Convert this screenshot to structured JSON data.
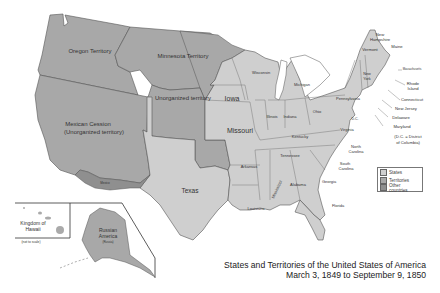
{
  "map": {
    "title": "States and Territories of the United States of America",
    "subtitle": "March 3, 1849 to September 9, 1850",
    "colors": {
      "states": "#cfcfcf",
      "territories": "#a8a8a8",
      "other_countries": "#8f8f8f",
      "border": "#555555",
      "water": "#ffffff"
    },
    "legend": [
      {
        "label": "States",
        "color": "#cfcfcf"
      },
      {
        "label": "Territories",
        "color": "#a8a8a8"
      },
      {
        "label": "Other countries",
        "color": "#8f8f8f"
      }
    ],
    "territories": {
      "oregon": "Oregon Territory",
      "minnesota": "Minnesota Territory",
      "unorganized": "Unorganized territory",
      "mexican_cession_1": "Mexican Cession",
      "mexican_cession_2": "(Unorganized territory)",
      "mexico": "Mexico"
    },
    "states": {
      "texas": "Texas",
      "iowa": "Iowa",
      "missouri": "Missouri",
      "wisconsin": "Wisconsin",
      "michigan": "Michigan",
      "illinois": "Illinois",
      "indiana": "Indiana",
      "ohio": "Ohio",
      "kentucky": "Kentucky",
      "tennessee": "Tennessee",
      "arkansas": "Arkansas",
      "louisiana": "Louisiana",
      "mississippi": "Mississippi",
      "alabama": "Alabama",
      "georgia": "Georgia",
      "florida": "Florida",
      "south_carolina_1": "South",
      "south_carolina_2": "Carolina",
      "north_carolina_1": "North",
      "north_carolina_2": "Carolina",
      "virginia": "Virginia",
      "pennsylvania": "Pennsylvania",
      "new_york_1": "New",
      "new_york_2": "York",
      "dc": "D.C.",
      "vermont": "Vermont",
      "new_hampshire_1": "New",
      "new_hampshire_2": "Hampshire",
      "maine": "Maine",
      "massachusetts": "Massachusetts",
      "rhode_island_1": "Rhode",
      "rhode_island_2": "Island",
      "connecticut": "Connecticut",
      "new_jersey": "New Jersey",
      "delaware": "Delaware",
      "maryland": "Maryland",
      "dc_note_1": "(D.C. = District",
      "dc_note_2": "of Columbia)"
    },
    "insets": {
      "hawaii_1": "Kingdom of",
      "hawaii_2": "Hawaii",
      "hawaii_note": "(not to scale)",
      "alaska_1": "Russian",
      "alaska_2": "America",
      "alaska_note": "(Russia)"
    }
  }
}
